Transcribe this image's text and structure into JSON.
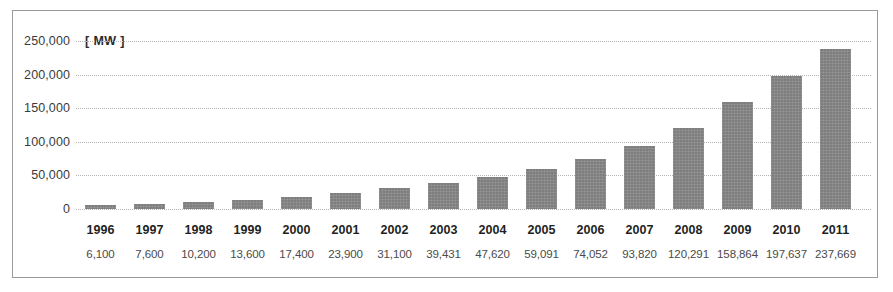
{
  "chart_data": {
    "type": "bar",
    "title": "",
    "subtitle": "",
    "xlabel": "",
    "ylabel": "",
    "unit_label": "[ MW ]",
    "categories": [
      "1996",
      "1997",
      "1998",
      "1999",
      "2000",
      "2001",
      "2002",
      "2003",
      "2004",
      "2005",
      "2006",
      "2007",
      "2008",
      "2009",
      "2010",
      "2011"
    ],
    "values": [
      6100,
      7600,
      10200,
      13600,
      17400,
      23900,
      31100,
      39431,
      47620,
      59091,
      74052,
      93820,
      120291,
      158864,
      197637,
      237669
    ],
    "value_labels": [
      "6,100",
      "7,600",
      "10,200",
      "13,600",
      "17,400",
      "23,900",
      "31,100",
      "39,431",
      "47,620",
      "59,091",
      "74,052",
      "93,820",
      "120,291",
      "158,864",
      "197,637",
      "237,669"
    ],
    "ylim": [
      0,
      250000
    ],
    "yticks": [
      0,
      50000,
      100000,
      150000,
      200000,
      250000
    ],
    "ytick_labels": [
      "0",
      "50,000",
      "100,000",
      "150,000",
      "200,000",
      "250,000"
    ],
    "grid": true,
    "grid_style": "dotted",
    "legend": null,
    "series": [
      {
        "name": "Cumulative installed capacity",
        "values": [
          6100,
          7600,
          10200,
          13600,
          17400,
          23900,
          31100,
          39431,
          47620,
          59091,
          74052,
          93820,
          120291,
          158864,
          197637,
          237669
        ]
      }
    ],
    "colors": {
      "bar": "#8a8a8a",
      "gridline": "#b5b5b5",
      "border": "#9a9a9a",
      "background": "#ffffff",
      "year_text": "#1f1f1f",
      "value_text": "#4a4a4a",
      "ytick_text": "#3b3b3b"
    }
  }
}
